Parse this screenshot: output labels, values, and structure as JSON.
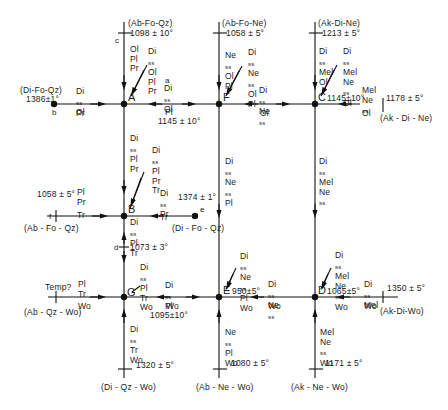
{
  "diagram": {
    "type": "Schreinemakers reaction network (invariant points)",
    "invariant_points": [
      {
        "id": "A",
        "label": "A"
      },
      {
        "id": "B",
        "label": "B"
      },
      {
        "id": "C",
        "label": "C",
        "temp": "1145±10°"
      },
      {
        "id": "D",
        "label": "D",
        "temp": "1065±5°"
      },
      {
        "id": "E",
        "label": "E",
        "temp": "950±5°"
      },
      {
        "id": "F",
        "label": "F"
      },
      {
        "id": "G",
        "label": "G"
      }
    ],
    "terminal_systems": {
      "top_A": {
        "system": "(Ab-Fo-Qz)",
        "temp": "1098 ± 10°",
        "letter": "c"
      },
      "top_F": {
        "system": "(Ab-Fo-Ne)",
        "temp": "1058 ± 5°"
      },
      "top_C": {
        "system": "(Ak-Di-Ne)",
        "temp": "1213 ± 5°"
      },
      "left_A": {
        "system": "(Di-Fo-Qz)",
        "temp": "1386±1°",
        "letter": "b"
      },
      "right_C": {
        "system": "(Ak - Di - Ne)",
        "temp": "1178 ± 5°"
      },
      "left_B": {
        "system": "(Ab - Fo - Qz)",
        "temp": "1058 ± 5°",
        "letter": "f"
      },
      "right_B": {
        "system": "(Di - Fo - Qz)",
        "temp": "1374 ± 1°",
        "letter": "e"
      },
      "left_G": {
        "system": "(Ab - Qz - Wo)",
        "temp": "Temp?"
      },
      "right_D": {
        "system": "(Ak-Di-Wo)",
        "temp": "1350 ± 5°"
      },
      "bottom_G": {
        "system": "(Di - Qz - Wo)",
        "temp": "1320 ± 5°"
      },
      "bottom_E": {
        "system": "(Ab - Ne - Wo)",
        "temp": "1080 ± 5°"
      },
      "bottom_D": {
        "system": "(Ak - Ne - Wo)",
        "temp": "1171 ± 5°"
      }
    },
    "edge_labels": {
      "A_top": [
        "Ol",
        "Pl",
        "Pr"
      ],
      "A_diag": [
        "Di_ss",
        "Ol",
        "Pl",
        "Pr"
      ],
      "A_left": [
        "Di_ss",
        "Ol",
        "Pr"
      ],
      "AF": {
        "letter": "a",
        "phases": [
          "Di_ss",
          "Ol",
          "Pl"
        ],
        "temp": "1145 ± 10°"
      },
      "AB": [
        "Di_ss",
        "Pl",
        "Pr"
      ],
      "F_top": [
        "Ne_ss",
        "Ol",
        "Pl"
      ],
      "F_diag": [
        "Di_ss",
        "Ne_ss",
        "Ol",
        "Pl"
      ],
      "FC": [
        "Di_ss",
        "Ne_ss",
        "Ol"
      ],
      "C_top": [
        "Di_ss",
        "Mel",
        "Ol"
      ],
      "C_diag": [
        "Di_ss",
        "Mel",
        "Ne_ss",
        "Ol"
      ],
      "C_right": [
        "Mel",
        "Ne_ss",
        "Ol"
      ],
      "B_diag": [
        "Di_ss",
        "Pl",
        "Pr",
        "Tr"
      ],
      "B_left": [
        "Pl",
        "Pr",
        "Tr"
      ],
      "B_right": [
        "Di_ss",
        "Pr",
        "Tr"
      ],
      "BG": {
        "letter": "d",
        "phases": [
          "Di_ss",
          "Pl",
          "Tr"
        ],
        "temp": "1073 ± 3°"
      },
      "FE": [
        "Di_ss",
        "Ne_ss",
        "Pl"
      ],
      "CD": [
        "Di_ss",
        "Mel",
        "Ne_ss"
      ],
      "G_diag": [
        "Di_ss",
        "Pl",
        "Tr",
        "Wo"
      ],
      "G_left": [
        "Pl",
        "Tr",
        "Wo"
      ],
      "GE": {
        "phases": [
          "Di_ss",
          "Pl",
          "Wo"
        ],
        "temp": "1095±10°"
      },
      "G_bottom": [
        "Di_ss",
        "Tr",
        "Wo"
      ],
      "E_diag": [
        "Di_ss",
        "Ne_ss",
        "Pl",
        "Wo"
      ],
      "ED": [
        "Di_ss",
        "Ne_ss",
        "Wo"
      ],
      "E_bottom": [
        "Ne_ss",
        "Pl",
        "Wo"
      ],
      "D_diag": [
        "Di_ss",
        "Mel",
        "Ne_ss",
        "Wo"
      ],
      "D_right": [
        "Di_ss",
        "Mel",
        "Wo"
      ],
      "D_bottom": [
        "Mel",
        "Ne_ss",
        "Wo"
      ]
    },
    "text": {
      "A": "A",
      "B": "B",
      "C": "C",
      "D": "D",
      "E": "E",
      "F": "F",
      "G": "G",
      "a": "a",
      "b": "b",
      "c": "c",
      "d": "d",
      "e": "e",
      "f": "f",
      "Ol": "Ol",
      "Pl": "Pl",
      "Pr": "Pr",
      "Tr": "Tr",
      "Wo": "Wo",
      "Mel": "Mel",
      "Di": "Di",
      "Ne": "Ne",
      "ss": "ss",
      "t_c": "1098 ± 10°",
      "s_c": "(Ab-Fo-Qz)",
      "t_F": "1058 ± 5°",
      "s_F": "(Ab-Fo-Ne)",
      "t_Ct": "1213 ± 5°",
      "s_Ct": "(Ak-Di-Ne)",
      "t_b": "1386±1°",
      "s_b": "(Di-Fo-Qz)",
      "t_a": "1145 ± 10°",
      "t_C": "1145±10°",
      "t_Cr": "1178 ± 5°",
      "s_Cr": "(Ak - Di - Ne)",
      "t_f": "1058 ± 5°",
      "s_f": "(Ab - Fo - Qz)",
      "t_e": "1374 ± 1°",
      "s_e": "(Di - Fo - Qz)",
      "t_d": "1073 ± 3°",
      "t_G": "Temp?",
      "s_G": "(Ab - Qz - Wo)",
      "t_GE": "1095±10°",
      "t_E": "950±5°",
      "t_D": "1065±5°",
      "t_Dr": "1350 ± 5°",
      "s_Dr": "(Ak-Di-Wo)",
      "t_Gb": "1320 ± 5°",
      "s_Gb": "(Di - Qz - Wo)",
      "t_Eb": "1080 ± 5°",
      "s_Eb": "(Ab - Ne - Wo)",
      "t_Db": "1171 ± 5°",
      "s_Db": "(Ak - Ne - Wo)"
    }
  }
}
